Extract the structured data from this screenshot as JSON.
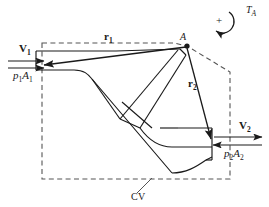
{
  "figure": {
    "type": "engineering-diagram",
    "width": 269,
    "height": 207,
    "background_color": "#ffffff",
    "line_color": "#1a1a1a",
    "dashed_color": "#555555"
  },
  "labels": {
    "inlet_velocity": {
      "symbol": "V",
      "subscript": "1",
      "text": "V1"
    },
    "inlet_pressure_force": {
      "symbol": "p",
      "sub1": "1",
      "symbol2": "A",
      "sub2": "1",
      "text": "p1A1"
    },
    "outlet_velocity": {
      "symbol": "V",
      "subscript": "2",
      "text": "V2"
    },
    "outlet_pressure_force": {
      "symbol": "p",
      "sub1": "2",
      "symbol2": "A",
      "sub2": "2",
      "text": "p2A2"
    },
    "position_vector_1": {
      "symbol": "r",
      "subscript": "1",
      "text": "r1"
    },
    "position_vector_2": {
      "symbol": "r",
      "subscript": "2",
      "text": "r2"
    },
    "torque": {
      "symbol": "T",
      "subscript": "A",
      "text": "TA"
    },
    "moment_point": {
      "text": "A"
    },
    "control_volume": {
      "text": "CV"
    },
    "torque_sign": {
      "text": "+"
    }
  },
  "icons": {
    "torque_arc": "counterclockwise-rotation-arrow-icon",
    "point_marker": "filled-dot-icon",
    "arrow_head": "arrowhead-icon"
  },
  "geometry": {
    "point_A": {
      "x": 187,
      "y": 46
    },
    "inlet_center": {
      "x": 52,
      "y": 60
    },
    "outlet_center": {
      "x": 212,
      "y": 141
    },
    "cv_polygon": "dashed closed polygon enclosing the duct",
    "duct": "horizontal inlet at left bending diagonally down-right then horizontal outlet at right"
  }
}
